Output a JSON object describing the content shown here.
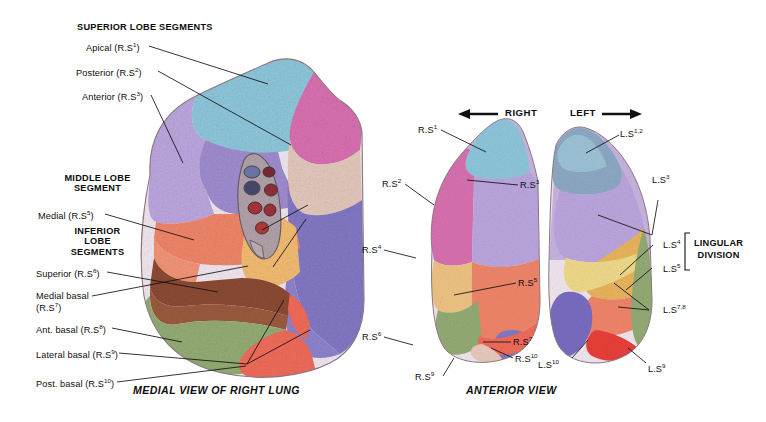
{
  "figure": {
    "title_left_caption": "MEDIAL VIEW OF RIGHT LUNG",
    "title_right_caption": "ANTERIOR VIEW",
    "direction_right": "RIGHT",
    "direction_left": "LEFT",
    "lingular_line1": "LINGULAR",
    "lingular_line2": "DIVISION"
  },
  "left_panel": {
    "group_headers": [
      {
        "id": "superior-lobe",
        "text": "SUPERIOR LOBE SEGMENTS"
      },
      {
        "id": "middle-lobe",
        "line1": "MIDDLE LOBE",
        "line2": "SEGMENT"
      },
      {
        "id": "inferior-lobe",
        "line1": "INFERIOR",
        "line2": "LOBE",
        "line3": "SEGMENTS"
      }
    ],
    "labels": [
      {
        "id": "apical",
        "name": "Apical (R.S",
        "sup": "1",
        "tail": ")"
      },
      {
        "id": "posterior",
        "name": "Posterior (R.S",
        "sup": "2",
        "tail": ")"
      },
      {
        "id": "anterior",
        "name": "Anterior (R.S",
        "sup": "3",
        "tail": ")"
      },
      {
        "id": "medial",
        "name": "Medial (R.S",
        "sup": "5",
        "tail": ")"
      },
      {
        "id": "superior",
        "name": "Superior (R.S",
        "sup": "6",
        "tail": ")"
      },
      {
        "id": "medial-basal",
        "name": "Medial basal",
        "sup": "",
        "tail": ""
      },
      {
        "id": "medial-basal-2",
        "name": "(R.S",
        "sup": "7",
        "tail": ")"
      },
      {
        "id": "ant-basal",
        "name": "Ant. basal (R.S",
        "sup": "8",
        "tail": ")"
      },
      {
        "id": "lateral-basal",
        "name": "Lateral basal (R.S",
        "sup": "9",
        "tail": ")"
      },
      {
        "id": "post-basal",
        "name": "Post. basal (R.S",
        "sup": "10",
        "tail": ")"
      }
    ]
  },
  "right_panel": {
    "right_lung_labels": [
      {
        "id": "rs1",
        "name": "R.S",
        "sup": "1"
      },
      {
        "id": "rs2",
        "name": "R.S",
        "sup": "2"
      },
      {
        "id": "rs3",
        "name": "R.S",
        "sup": "3"
      },
      {
        "id": "rs4",
        "name": "R.S",
        "sup": "4"
      },
      {
        "id": "rs5",
        "name": "R.S",
        "sup": "5"
      },
      {
        "id": "rs6",
        "name": "R.S",
        "sup": "6"
      },
      {
        "id": "rs7",
        "name": "R.S",
        "sup": "7"
      },
      {
        "id": "rs9",
        "name": "R.S",
        "sup": "9"
      },
      {
        "id": "rs10",
        "name": "R.S",
        "sup": "10"
      }
    ],
    "left_lung_labels": [
      {
        "id": "ls12",
        "name": "L.S",
        "sup": "1,2"
      },
      {
        "id": "ls3",
        "name": "L.S",
        "sup": "3"
      },
      {
        "id": "ls4",
        "name": "L.S",
        "sup": "4"
      },
      {
        "id": "ls5",
        "name": "L.S",
        "sup": "5"
      },
      {
        "id": "ls78",
        "name": "L.S",
        "sup": "7,8"
      },
      {
        "id": "ls9",
        "name": "L.S",
        "sup": "9"
      },
      {
        "id": "ls10",
        "name": "L.S",
        "sup": "10"
      }
    ]
  },
  "palette": {
    "apical_blue": "#8ec6db",
    "posterior_magenta": "#d870b0",
    "anterior_lavender": "#a991d4",
    "anterior_pale": "#c7b4e0",
    "medial_salmon": "#ef8569",
    "lateral_tan": "#e8c9bd",
    "superior_brown": "#8c4a33",
    "medial_basal_orange": "#f2bb71",
    "ant_basal_green": "#93ab74",
    "lateral_basal_red": "#ef6b5a",
    "post_basal_violet": "#8278c4",
    "lingula_gold": "#e8b45c",
    "lingula_yellow": "#efd98a",
    "outline": "#5a4a52"
  }
}
